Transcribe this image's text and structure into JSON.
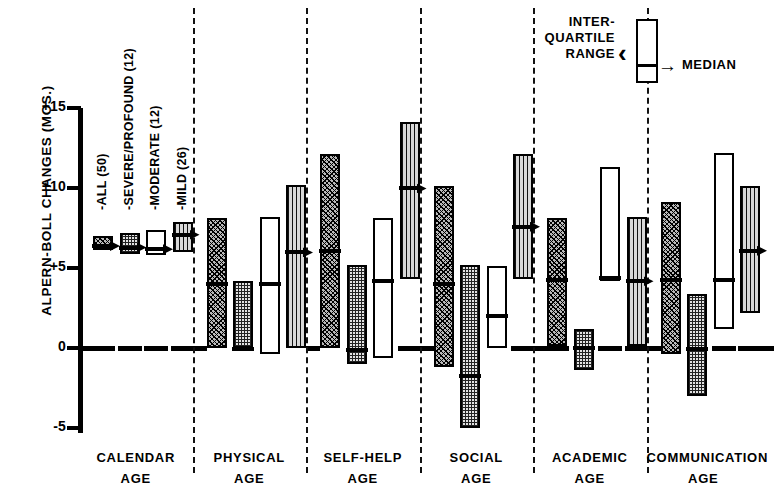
{
  "chart_data": {
    "type": "bar",
    "title": "",
    "xlabel": "",
    "ylabel": "ALPERN-BOLL CHANGES (MOS.)",
    "ylim": [
      -5,
      15
    ],
    "yticks": [
      "+15",
      "+10",
      "+5",
      "0",
      "-5"
    ],
    "ytick_values": [
      15,
      10,
      5,
      0,
      -5
    ],
    "grid": false,
    "legend_position": "top-right",
    "categories": [
      "CALENDAR AGE",
      "PHYSICAL AGE",
      "SELF-HELP AGE",
      "SOCIAL AGE",
      "ACADEMIC AGE",
      "COMMUNICATION AGE"
    ],
    "series": [
      {
        "name": "ALL (50)",
        "label": "-ALL (50)",
        "pattern": "diagonal-crosshatch",
        "n": 50,
        "boxes": [
          {
            "category": "CALENDAR AGE",
            "q1": 6.1,
            "median": 6.5,
            "q3": 7.0
          },
          {
            "category": "PHYSICAL AGE",
            "q1": 0.0,
            "median": 4.1,
            "q3": 8.1
          },
          {
            "category": "SELF-HELP AGE",
            "q1": 0.0,
            "median": 6.2,
            "q3": 12.1
          },
          {
            "category": "SOCIAL AGE",
            "q1": -1.2,
            "median": 4.1,
            "q3": 10.1
          },
          {
            "category": "ACADEMIC AGE",
            "q1": 0.1,
            "median": 4.4,
            "q3": 8.1
          },
          {
            "category": "COMMUNICATION AGE",
            "q1": -0.4,
            "median": 4.4,
            "q3": 9.1
          }
        ]
      },
      {
        "name": "SEVERE/PROFOUND (12)",
        "label": "-SEVERE/PROFOUND (12)",
        "pattern": "fine-grid",
        "n": 12,
        "boxes": [
          {
            "category": "CALENDAR AGE",
            "q1": 5.9,
            "median": 6.4,
            "q3": 7.2
          },
          {
            "category": "PHYSICAL AGE",
            "q1": 0.0,
            "median": 0.05,
            "q3": 4.2
          },
          {
            "category": "SELF-HELP AGE",
            "q1": -1.0,
            "median": 0.0,
            "q3": 5.2
          },
          {
            "category": "SOCIAL AGE",
            "q1": -5.0,
            "median": -1.6,
            "q3": 5.2
          },
          {
            "category": "ACADEMIC AGE",
            "q1": -1.4,
            "median": 0.1,
            "q3": 1.2
          },
          {
            "category": "COMMUNICATION AGE",
            "q1": -3.0,
            "median": 0.05,
            "q3": 3.4
          }
        ]
      },
      {
        "name": "MODERATE (12)",
        "label": "-MODERATE (12)",
        "pattern": "open-white",
        "n": 12,
        "boxes": [
          {
            "category": "CALENDAR AGE",
            "q1": 5.8,
            "median": 6.3,
            "q3": 7.4
          },
          {
            "category": "PHYSICAL AGE",
            "q1": -0.4,
            "median": 4.1,
            "q3": 8.2
          },
          {
            "category": "SELF-HELP AGE",
            "q1": -0.6,
            "median": 4.3,
            "q3": 8.1
          },
          {
            "category": "SOCIAL AGE",
            "q1": 0.0,
            "median": 2.1,
            "q3": 5.1
          },
          {
            "category": "ACADEMIC AGE",
            "q1": 4.2,
            "median": 4.5,
            "q3": 11.3
          },
          {
            "category": "COMMUNICATION AGE",
            "q1": 1.2,
            "median": 4.4,
            "q3": 12.2
          }
        ]
      },
      {
        "name": "MILD (26)",
        "label": "-MILD (26)",
        "pattern": "vertical-stripe",
        "n": 26,
        "boxes": [
          {
            "category": "CALENDAR AGE",
            "q1": 6.0,
            "median": 7.2,
            "q3": 7.9
          },
          {
            "category": "PHYSICAL AGE",
            "q1": 0.0,
            "median": 6.1,
            "q3": 10.2
          },
          {
            "category": "SELF-HELP AGE",
            "q1": 4.3,
            "median": 10.1,
            "q3": 14.1
          },
          {
            "category": "SOCIAL AGE",
            "q1": 4.3,
            "median": 7.7,
            "q3": 12.1
          },
          {
            "category": "ACADEMIC AGE",
            "q1": 0.1,
            "median": 4.3,
            "q3": 8.2
          },
          {
            "category": "COMMUNICATION AGE",
            "q1": 2.2,
            "median": 6.2,
            "q3": 10.1
          }
        ]
      }
    ]
  },
  "axis": {
    "y_title": "ALPERN-BOLL CHANGES (MOS.)",
    "ticks": [
      {
        "label": "+15",
        "value": 15
      },
      {
        "label": "+10",
        "value": 10
      },
      {
        "label": "+5",
        "value": 5
      },
      {
        "label": "0",
        "value": 0
      },
      {
        "label": "-5",
        "value": -5
      }
    ]
  },
  "series_labels": [
    "-ALL (50)",
    "-SEVERE/PROFOUND (12)",
    "-MODERATE (12)",
    "-MILD (26)"
  ],
  "category_labels": [
    {
      "line1": "CALENDAR",
      "line2": "AGE"
    },
    {
      "line1": "PHYSICAL",
      "line2": "AGE"
    },
    {
      "line1": "SELF-HELP",
      "line2": "AGE"
    },
    {
      "line1": "SOCIAL",
      "line2": "AGE"
    },
    {
      "line1": "ACADEMIC",
      "line2": "AGE"
    },
    {
      "line1": "COMMUNICATION",
      "line2": "AGE"
    }
  ],
  "legend": {
    "range_line1": "INTER-",
    "range_line2": "QUARTILE",
    "range_line3": "RANGE",
    "median_label": "MEDIAN",
    "bracket_glyph": "‹",
    "arrow_glyph": "→"
  },
  "colors": {
    "ink": "#000000",
    "background": "#ffffff"
  }
}
